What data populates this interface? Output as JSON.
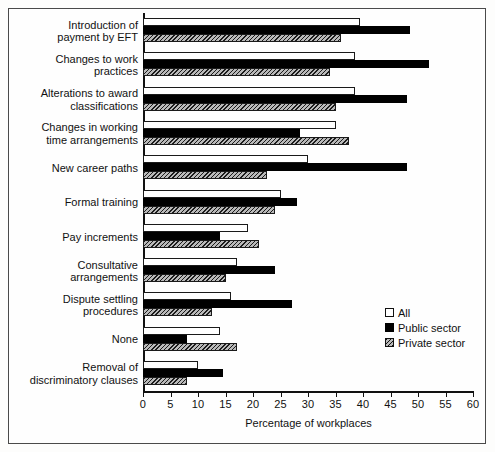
{
  "chart_data": {
    "type": "bar",
    "orientation": "horizontal",
    "title": "",
    "xlabel": "Percentage of workplaces",
    "ylabel": "",
    "xlim": [
      0,
      60
    ],
    "xticks": [
      0,
      5,
      10,
      15,
      20,
      25,
      30,
      35,
      40,
      45,
      50,
      55,
      60
    ],
    "grid": false,
    "legend_position": "right-middle",
    "categories": [
      "Introduction of payment by EFT",
      "Changes to work practices",
      "Alterations to award classifications",
      "Changes in working time arrangements",
      "New career paths",
      "Formal training",
      "Pay increments",
      "Consultative arrangements",
      "Dispute settling procedures",
      "None",
      "Removal of discriminatory clauses"
    ],
    "category_lines": [
      [
        "Introduction of",
        "payment by EFT"
      ],
      [
        "Changes to work",
        "practices"
      ],
      [
        "Alterations to award",
        "classifications"
      ],
      [
        "Changes in working",
        "time arrangements"
      ],
      [
        "New career paths"
      ],
      [
        "Formal training"
      ],
      [
        "Pay increments"
      ],
      [
        "Consultative",
        "arrangements"
      ],
      [
        "Dispute settling",
        "procedures"
      ],
      [
        "None"
      ],
      [
        "Removal of",
        "discriminatory clauses"
      ]
    ],
    "series": [
      {
        "name": "All",
        "fill": "white",
        "values": [
          39.5,
          38.5,
          38.5,
          35.0,
          30.0,
          25.0,
          19.0,
          17.0,
          16.0,
          14.0,
          10.0
        ]
      },
      {
        "name": "Public sector",
        "fill": "black",
        "values": [
          48.5,
          52.0,
          48.0,
          28.5,
          48.0,
          28.0,
          14.0,
          24.0,
          27.0,
          8.0,
          14.5
        ]
      },
      {
        "name": "Private sector",
        "fill": "hatched-gray",
        "values": [
          36.0,
          34.0,
          35.0,
          37.5,
          22.5,
          24.0,
          21.0,
          15.0,
          12.5,
          17.0,
          8.0
        ]
      }
    ]
  },
  "legend": {
    "items": [
      {
        "label": "All",
        "swatch": "white-square-icon"
      },
      {
        "label": "Public sector",
        "swatch": "black-square-icon"
      },
      {
        "label": "Private sector",
        "swatch": "hatched-square-icon"
      }
    ]
  }
}
